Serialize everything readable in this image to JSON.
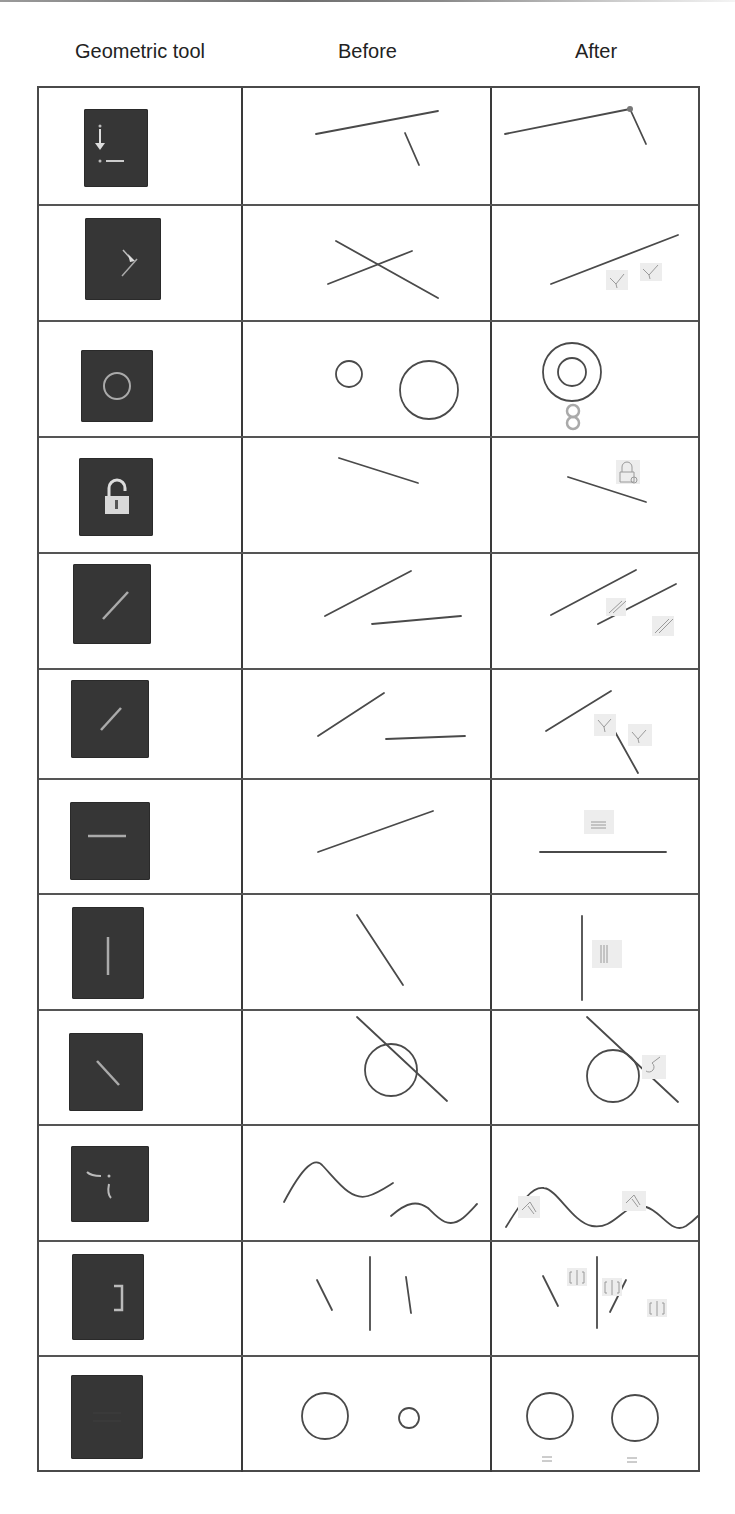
{
  "header": {
    "col_tool": "Geometric tool",
    "col_before": "Before",
    "col_after": "After"
  },
  "colors": {
    "icon_background": "#363636",
    "icon_glyph": "#b8b8b8",
    "line": "#4a4a4a",
    "constraint_glyph": "#9a9a9a",
    "grid_border": "#4a4a4a"
  },
  "rows": [
    {
      "tool": "coincident",
      "icon": "coincident-icon",
      "before": "two separate lines",
      "after": "lines joined at a common endpoint"
    },
    {
      "tool": "perpendicular",
      "icon": "perpendicular-icon",
      "before": "two crossing lines",
      "after": "lines made perpendicular with perpendicular markers"
    },
    {
      "tool": "concentric",
      "icon": "concentric-icon",
      "before": "small and large circle apart",
      "after": "concentric circles with concentric markers"
    },
    {
      "tool": "fix",
      "icon": "lock-icon",
      "before": "single line",
      "after": "line with lock marker"
    },
    {
      "tool": "parallel",
      "icon": "parallel-icon",
      "before": "two non-parallel lines",
      "after": "two parallel lines with parallel markers"
    },
    {
      "tool": "perpendicular-2",
      "icon": "perpendicular-line-icon",
      "before": "two lines",
      "after": "two perpendicular lines with markers"
    },
    {
      "tool": "horizontal",
      "icon": "horizontal-icon",
      "before": "slanted line",
      "after": "horizontal line with horizontal marker"
    },
    {
      "tool": "vertical",
      "icon": "vertical-icon",
      "before": "slanted line",
      "after": "vertical line with vertical marker"
    },
    {
      "tool": "tangent",
      "icon": "tangent-icon",
      "before": "line crossing a circle",
      "after": "line tangent to circle with tangent marker"
    },
    {
      "tool": "smooth",
      "icon": "smooth-icon",
      "before": "two separate curves",
      "after": "curves joined smoothly with smooth markers"
    },
    {
      "tool": "symmetric",
      "icon": "symmetric-icon",
      "before": "two lines and a centerline",
      "after": "lines symmetric about centerline with symmetry markers"
    },
    {
      "tool": "equal",
      "icon": "equal-icon",
      "before": "large and small circle",
      "after": "two equal circles with equal markers"
    }
  ]
}
